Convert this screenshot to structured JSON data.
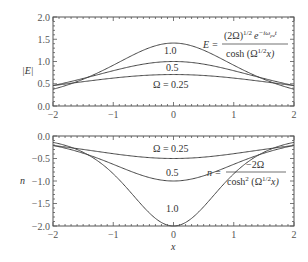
{
  "chart_data": [
    {
      "type": "line",
      "title": "",
      "xlabel": "",
      "ylabel": "|E|",
      "xlim": [
        -2,
        2
      ],
      "ylim": [
        0,
        2.0
      ],
      "xticks": [
        "-2",
        "-1",
        "0",
        "1",
        "2"
      ],
      "yticks": [
        "0.0",
        "0.5",
        "1.0",
        "1.5",
        "2.0"
      ],
      "formula": {
        "lhs": "E =",
        "numerator": "(2Ω)^1/2 e^−iω_p e t",
        "numerator_main": "(2Ω)",
        "numerator_sup1": "1/2",
        "numerator_exp": "e",
        "numerator_sup2": "−iω",
        "numerator_sub": "pe",
        "numerator_t": "t",
        "denominator": "cosh (Ω^1/2 x)",
        "denominator_main": "cosh (Ω",
        "denominator_sup": "1/2",
        "denominator_end": "x)"
      },
      "function": "sqrt(2*Omega)/cosh(sqrt(Omega)*x)",
      "series": [
        {
          "name": "Ω = 0.25",
          "label": "Ω = 0.25",
          "omega": 0.25,
          "peak": 0.707
        },
        {
          "name": "0.5",
          "label": "0.5",
          "omega": 0.5,
          "peak": 1.0
        },
        {
          "name": "1.0",
          "label": "1.0",
          "omega": 1.0,
          "peak": 1.414
        }
      ],
      "grid": false
    },
    {
      "type": "line",
      "title": "",
      "xlabel": "x",
      "ylabel": "n",
      "xlim": [
        -2,
        2
      ],
      "ylim": [
        -2.0,
        0.0
      ],
      "xticks": [
        "-2",
        "-1",
        "0",
        "1",
        "2"
      ],
      "yticks": [
        "-2.0",
        "-1.5",
        "-1.0",
        "-0.5",
        "0.0"
      ],
      "formula": {
        "lhs": "n =",
        "numerator": "−2Ω",
        "denominator": "cosh² (Ω^1/2 x)",
        "denominator_main": "cosh",
        "denominator_sup0": "2",
        "denominator_mid": " (Ω",
        "denominator_sup": "1/2",
        "denominator_end": "x)"
      },
      "function": "-2*Omega/cosh(sqrt(Omega)*x)^2",
      "series": [
        {
          "name": "Ω = 0.25",
          "label": "Ω = 0.25",
          "omega": 0.25,
          "min": -0.5
        },
        {
          "name": "0.5",
          "label": "0.5",
          "omega": 0.5,
          "min": -1.0
        },
        {
          "name": "1.0",
          "label": "1.0",
          "omega": 1.0,
          "min": -2.0
        }
      ],
      "grid": false
    }
  ]
}
